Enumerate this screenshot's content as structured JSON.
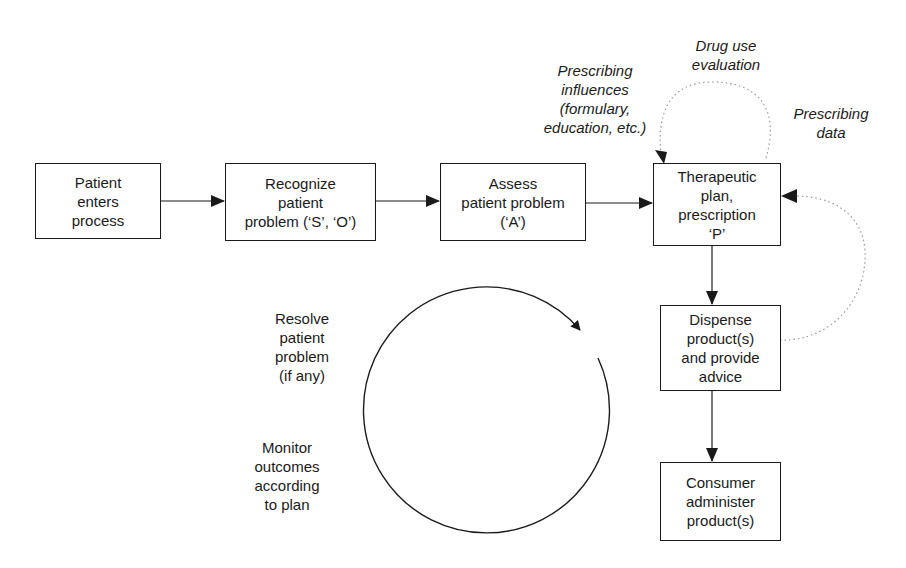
{
  "diagram": {
    "boxes": [
      {
        "id": "patient-enters",
        "lines": [
          "Patient",
          "enters",
          "process"
        ]
      },
      {
        "id": "recognize-problem",
        "lines": [
          "Recognize",
          "patient",
          "problem (‘S’, ‘O’)"
        ]
      },
      {
        "id": "assess-problem",
        "lines": [
          "Assess",
          "patient problem",
          "(‘A’)"
        ]
      },
      {
        "id": "therapeutic-plan",
        "lines": [
          "Therapeutic",
          "plan,",
          "prescription",
          "‘P’"
        ]
      },
      {
        "id": "dispense-products",
        "lines": [
          "Dispense",
          "product(s)",
          "and provide",
          "advice"
        ]
      },
      {
        "id": "consumer-administer",
        "lines": [
          "Consumer",
          "administer",
          "product(s)"
        ]
      }
    ],
    "annotations": {
      "drug_use_evaluation": [
        "Drug use",
        "evaluation"
      ],
      "prescribing_influences": [
        "Prescribing",
        "influences",
        "(formulary,",
        "education, etc.)"
      ],
      "prescribing_data": [
        "Prescribing",
        "data"
      ],
      "resolve_problem": [
        "Resolve",
        "patient",
        "problem",
        "(if any)"
      ],
      "monitor_outcomes": [
        "Monitor",
        "outcomes",
        "according",
        "to plan"
      ]
    },
    "edges": [
      {
        "from": "patient-enters",
        "to": "recognize-problem",
        "style": "solid"
      },
      {
        "from": "recognize-problem",
        "to": "assess-problem",
        "style": "solid"
      },
      {
        "from": "assess-problem",
        "to": "therapeutic-plan",
        "style": "solid"
      },
      {
        "from": "therapeutic-plan",
        "to": "dispense-products",
        "style": "solid"
      },
      {
        "from": "dispense-products",
        "to": "consumer-administer",
        "style": "solid"
      },
      {
        "from": "therapeutic-plan",
        "to": "therapeutic-plan",
        "label": "Drug use evaluation",
        "style": "dotted"
      },
      {
        "from": "dispense-products",
        "to": "therapeutic-plan",
        "label": "Prescribing data",
        "style": "dotted"
      }
    ],
    "colors": {
      "ink": "#1a1a1a",
      "dotted": "#9a9a9a",
      "background": "#ffffff"
    }
  }
}
